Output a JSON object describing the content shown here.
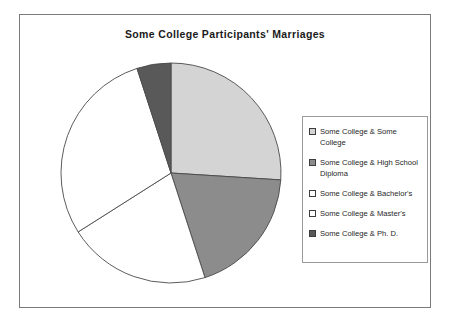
{
  "chart_data": {
    "type": "pie",
    "title": "Some College Participants' Marriages",
    "categories": [
      "Some College & Some College",
      "Some College & High School Diploma",
      "Some College & Bachelor's",
      "Some College & Master's",
      "Some College & Ph. D."
    ],
    "values": [
      26,
      19,
      21,
      29,
      5
    ],
    "colors": [
      "#d4d4d4",
      "#8c8c8c",
      "#ffffff",
      "#ffffff",
      "#595959"
    ],
    "start_angle_deg": 0,
    "direction": "clockwise",
    "legend_position": "right",
    "grid": false,
    "xlabel": "",
    "ylabel": ""
  },
  "legend": {
    "items": [
      {
        "label": "Some College & Some College",
        "swatch": "#d4d4d4"
      },
      {
        "label": "Some College & High School\nDiploma",
        "swatch": "#8c8c8c"
      },
      {
        "label": "Some College & Bachelor's",
        "swatch": "#ffffff"
      },
      {
        "label": "Some College & Master's",
        "swatch": "#ffffff"
      },
      {
        "label": "Some College & Ph. D.",
        "swatch": "#595959"
      }
    ]
  }
}
